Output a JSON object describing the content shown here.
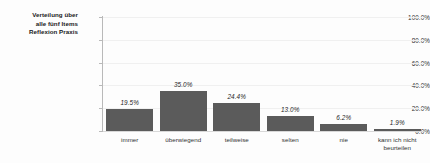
{
  "chart_data": {
    "type": "bar",
    "title": "Verteilung über alle fünf Items Reflexion Praxis",
    "title_lines": [
      "Verteilung über",
      "alle fünf Items",
      "Reflexion Praxis"
    ],
    "xlabel": "",
    "ylabel": "",
    "categories": [
      "immer",
      "überwiegend",
      "teilweise",
      "selten",
      "nie",
      "kann ich nicht beurteilen"
    ],
    "category_lines": [
      [
        "immer"
      ],
      [
        "überwiegend"
      ],
      [
        "teilweise"
      ],
      [
        "selten"
      ],
      [
        "nie"
      ],
      [
        "kann ich nicht",
        "beurteilen"
      ]
    ],
    "values": [
      19.5,
      35.0,
      24.4,
      13.0,
      6.2,
      1.9
    ],
    "value_labels": [
      "19.5%",
      "35.0%",
      "24.4%",
      "13.0%",
      "6.2%",
      "1.9%"
    ],
    "ylim": [
      0,
      100
    ],
    "yticks": [
      0,
      20,
      40,
      60,
      80,
      100
    ],
    "ytick_labels": [
      "0.0%",
      "20.0%",
      "40.0%",
      "60.0%",
      "80.0%",
      "100.0%"
    ],
    "grid": true,
    "legend": false,
    "bar_color": "#5b5b5b",
    "background_color": "#fdfdfd"
  }
}
